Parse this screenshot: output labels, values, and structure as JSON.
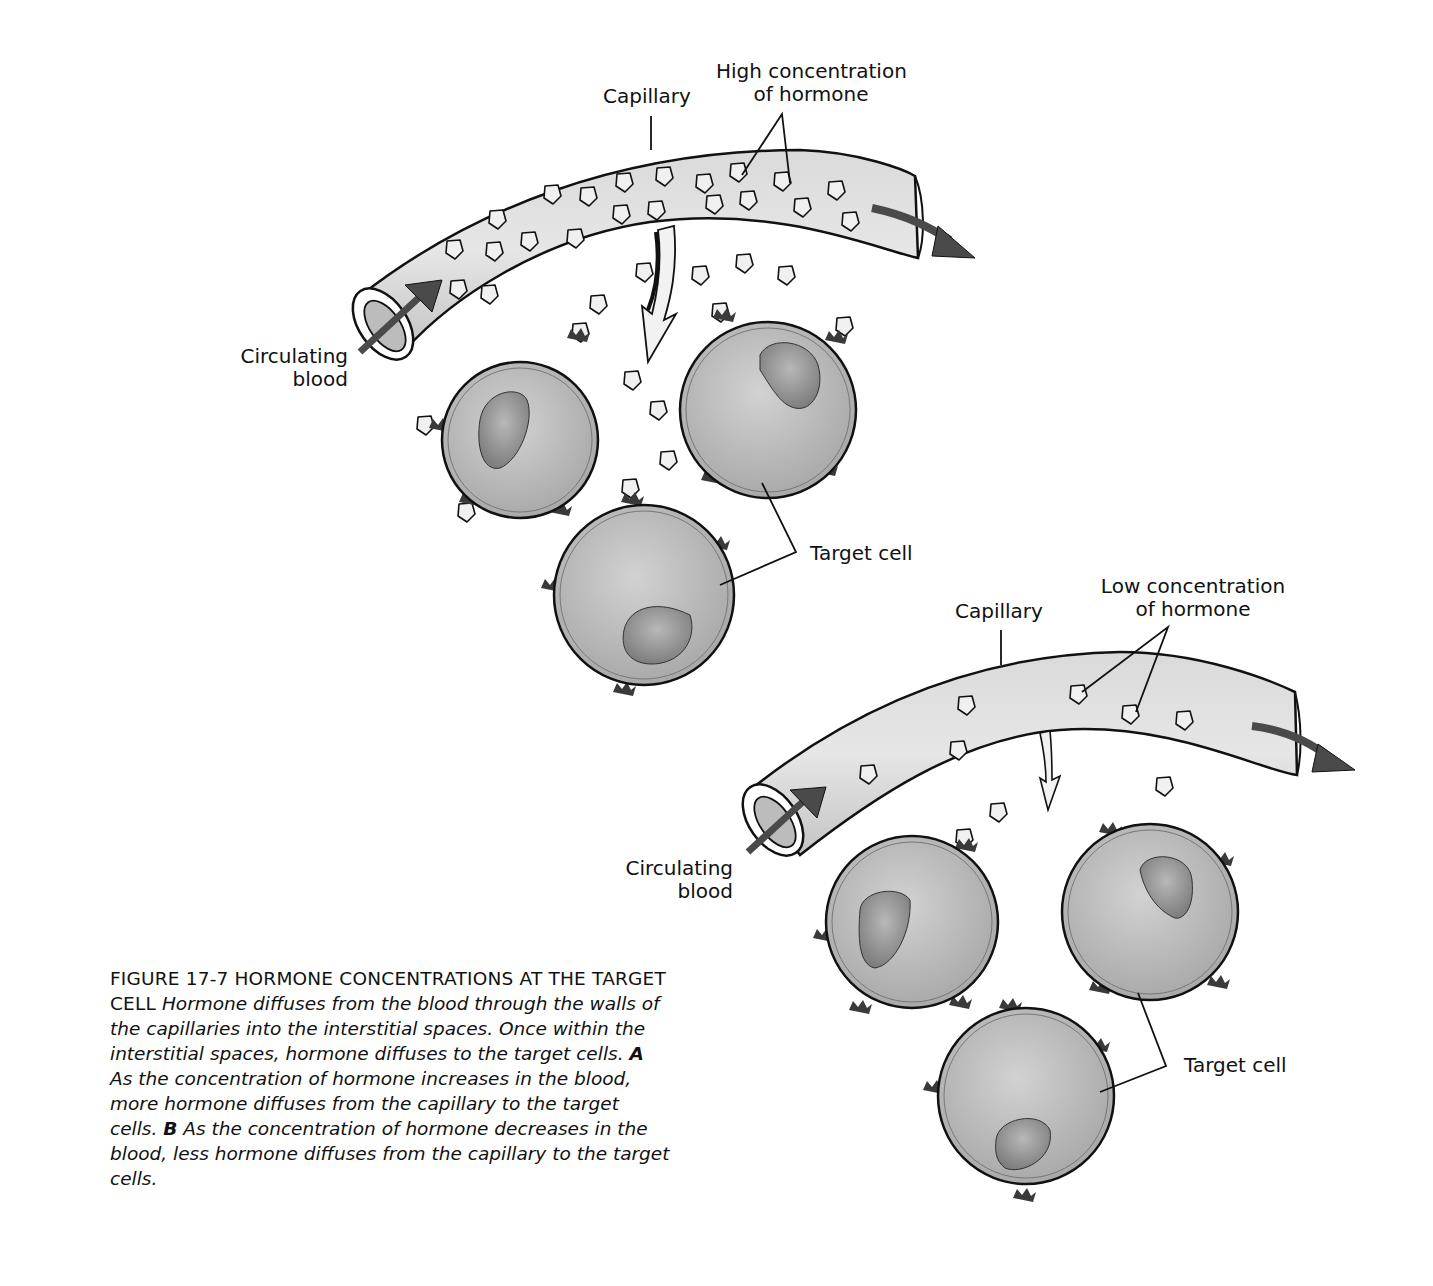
{
  "figure": {
    "number": "FIGURE 17-7",
    "title": "HORMONE CONCENTRATIONS AT THE TARGET CELL",
    "caption_intro": "Hormone diffuses from the blood through the walls of the capillaries into the interstitial spaces. Once within the interstitial spaces, hormone diffuses to the target cells.",
    "part_a_marker": "A",
    "part_a_text": "As the concentration of hormone increases in the blood, more hormone diffuses from the capillary to the target cells.",
    "part_b_marker": "B",
    "part_b_text": "As the concentration of hormone decreases in the blood, less hormone diffuses from the capillary to the target cells."
  },
  "panel_a": {
    "capillary_label": "Capillary",
    "concentration_label_line1": "High concentration",
    "concentration_label_line2": "of hormone",
    "blood_label_line1": "Circulating",
    "blood_label_line2": "blood",
    "target_label": "Target cell"
  },
  "panel_b": {
    "capillary_label": "Capillary",
    "concentration_label_line1": "Low concentration",
    "concentration_label_line2": "of hormone",
    "blood_label_line1": "Circulating",
    "blood_label_line2": "blood",
    "target_label": "Target cell"
  },
  "colors": {
    "capillary_fill": "#d6d6d6",
    "cell_fill": "#c4c4c4",
    "nucleus_fill": "#9a9a9a",
    "receptor_fill": "#3a3a3a",
    "hormone_fill": "#eeeeee",
    "arrow_dark": "#4a4a4a",
    "outline": "#111111"
  }
}
